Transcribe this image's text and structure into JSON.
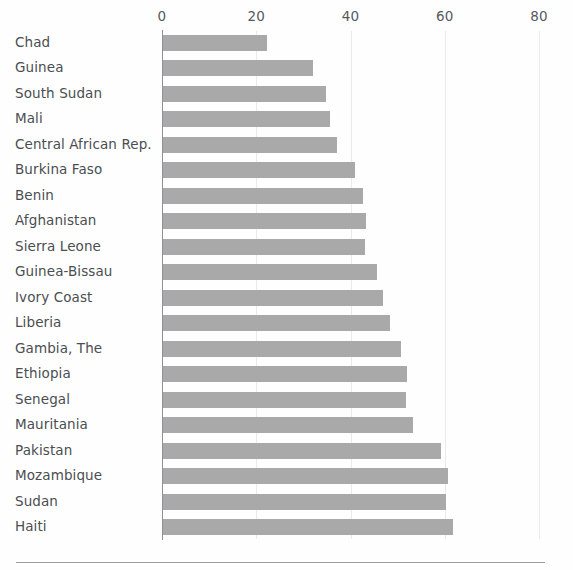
{
  "chart_data": {
    "type": "bar",
    "orientation": "horizontal",
    "title": "",
    "subtitle": "",
    "xlabel": "",
    "ylabel": "",
    "xlim": [
      0,
      80
    ],
    "xticks": [
      0,
      20,
      40,
      60,
      80
    ],
    "xtick_labels": [
      "0",
      "20",
      "40",
      "60",
      "80"
    ],
    "grid": true,
    "grid_axis": "x",
    "legend": false,
    "legend_position": "none",
    "bar_color": "#a9a9a9",
    "axis_color": "#8e9295",
    "gridline_color": "#e9eaec",
    "label_color": "#4a4e51",
    "categories": [
      "Chad",
      "Guinea",
      "South Sudan",
      "Mali",
      "Central African Rep.",
      "Burkina Faso",
      "Benin",
      "Afghanistan",
      "Sierra Leone",
      "Guinea-Bissau",
      "Ivory Coast",
      "Liberia",
      "Gambia, The",
      "Ethiopia",
      "Senegal",
      "Mauritania",
      "Pakistan",
      "Mozambique",
      "Sudan",
      "Haiti"
    ],
    "values": [
      22.3,
      32.0,
      34.8,
      35.7,
      37.2,
      41.0,
      42.6,
      43.2,
      43.0,
      45.7,
      47.0,
      48.3,
      50.7,
      52.0,
      51.7,
      53.3,
      59.3,
      60.7,
      60.3,
      61.7
    ]
  }
}
